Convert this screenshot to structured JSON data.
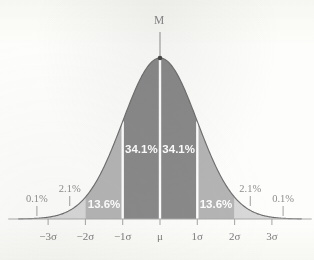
{
  "figure": {
    "peak_label": "M",
    "background_color": "#fdfdfb"
  },
  "colors": {
    "band_center": "#8a8a8a",
    "band_middle": "#b5b5b5",
    "band_outer": "#d8d8d8",
    "curve_stroke": "#6f6f6f",
    "axis": "#a9a9a9",
    "label_text": "#7d7d7d",
    "inner_label_text": "#ffffff",
    "outer_label_text": "#8e8e8e",
    "divider": "#ffffff"
  },
  "chart_data": {
    "type": "area",
    "title": "",
    "subtitle": "",
    "xlabel": "",
    "ylabel": "",
    "distribution": "normal",
    "mean": 0,
    "std": 1,
    "xlim": [
      -3.8,
      3.8
    ],
    "ylim": [
      0,
      1
    ],
    "grid": false,
    "legend": null,
    "x_tick_values": [
      -3,
      -2,
      -1,
      0,
      1,
      2,
      3
    ],
    "x_tick_labels": [
      "−3σ",
      "−2σ",
      "−1σ",
      "μ",
      "1σ",
      "2σ",
      "3σ"
    ],
    "bands": [
      {
        "name": "below-3-sigma-left",
        "from": -3.8,
        "to": -3.0,
        "percent": "0.1%",
        "shade": "#d8d8d8",
        "label_inside": false
      },
      {
        "name": "minus-3-to-minus-2",
        "from": -3.0,
        "to": -2.0,
        "percent": "2.1%",
        "shade": "#d8d8d8",
        "label_inside": false
      },
      {
        "name": "minus-2-to-minus-1",
        "from": -2.0,
        "to": -1.0,
        "percent": "13.6%",
        "shade": "#b5b5b5",
        "label_inside": true
      },
      {
        "name": "minus-1-to-mu",
        "from": -1.0,
        "to": 0.0,
        "percent": "34.1%",
        "shade": "#8a8a8a",
        "label_inside": true
      },
      {
        "name": "mu-to-plus-1",
        "from": 0.0,
        "to": 1.0,
        "percent": "34.1%",
        "shade": "#8a8a8a",
        "label_inside": true
      },
      {
        "name": "plus-1-to-plus-2",
        "from": 1.0,
        "to": 2.0,
        "percent": "13.6%",
        "shade": "#b5b5b5",
        "label_inside": true
      },
      {
        "name": "plus-2-to-plus-3",
        "from": 2.0,
        "to": 3.0,
        "percent": "2.1%",
        "shade": "#d8d8d8",
        "label_inside": false
      },
      {
        "name": "above-3-sigma-right",
        "from": 3.0,
        "to": 3.8,
        "percent": "0.1%",
        "shade": "#d8d8d8",
        "label_inside": false
      }
    ],
    "annotations": [
      {
        "name": "peak-marker",
        "text": "M",
        "at_x": 0,
        "at_y": 1,
        "note": "pointer line from label down to curve apex"
      }
    ]
  },
  "labels": {
    "pct_34_left": "34.1%",
    "pct_34_right": "34.1%",
    "pct_136_left": "13.6%",
    "pct_136_right": "13.6%",
    "pct_21_left": "2.1%",
    "pct_21_right": "2.1%",
    "pct_01_left": "0.1%",
    "pct_01_right": "0.1%",
    "tick_minus3": "−3σ",
    "tick_minus2": "−2σ",
    "tick_minus1": "−1σ",
    "tick_mu": "μ",
    "tick_plus1": "1σ",
    "tick_plus2": "2σ",
    "tick_plus3": "3σ",
    "peak": "M"
  }
}
